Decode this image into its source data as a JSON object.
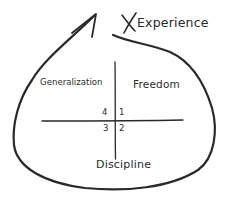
{
  "diagram": {
    "type": "hand-drawn quadrant diagram inside a looping arrow",
    "arrow": {
      "label": "Experience",
      "marker": "X"
    },
    "axes": {
      "top_left_label": "Generalization",
      "top_right_label": "Freedom",
      "bottom_label": "Discipline"
    },
    "quadrants": [
      {
        "position": "top-right",
        "number": "1"
      },
      {
        "position": "bottom-right",
        "number": "2"
      },
      {
        "position": "bottom-left",
        "number": "3"
      },
      {
        "position": "top-left",
        "number": "4"
      }
    ],
    "colors": {
      "stroke": "#2a2a2a",
      "background": "#ffffff"
    }
  }
}
